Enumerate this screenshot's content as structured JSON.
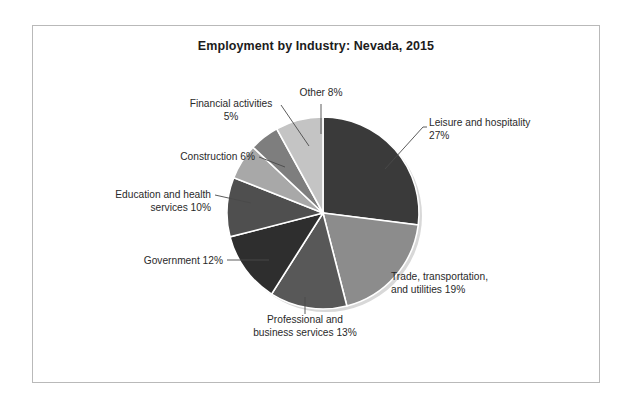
{
  "chart_data": {
    "type": "pie",
    "title": "Employment by Industry: Nevada, 2015",
    "xlabel": "",
    "ylabel": "",
    "legend_position": "none",
    "grid": false,
    "categories": [
      "Leisure and hospitality",
      "Trade, transportation, and utilities",
      "Professional and business services",
      "Government",
      "Education and health services",
      "Construction",
      "Financial activities",
      "Other"
    ],
    "values": [
      27,
      19,
      13,
      12,
      10,
      6,
      5,
      8
    ],
    "unit": "percent",
    "slices": [
      {
        "name": "Leisure and hospitality",
        "value": 27,
        "value_label": "27%",
        "label_line1": "Leisure and hospitality",
        "label_line2": "27%",
        "color": "#3a3a3a",
        "start_angle": 0,
        "end_angle": 97.2
      },
      {
        "name": "Trade, transportation, and utilities",
        "value": 19,
        "value_label": "19%",
        "label_line1": "Trade, transportation,",
        "label_line2": "and utilities 19%",
        "color": "#8c8c8c",
        "start_angle": 97.2,
        "end_angle": 165.6
      },
      {
        "name": "Professional and business services",
        "value": 13,
        "value_label": "13%",
        "label_line1": "Professional and",
        "label_line2": "business services 13%",
        "color": "#585858",
        "start_angle": 165.6,
        "end_angle": 212.4
      },
      {
        "name": "Government",
        "value": 12,
        "value_label": "12%",
        "label_line1": "Government 12%",
        "label_line2": "",
        "color": "#2e2e2e",
        "start_angle": 212.4,
        "end_angle": 255.6
      },
      {
        "name": "Education and health services",
        "value": 10,
        "value_label": "10%",
        "label_line1": "Education and health",
        "label_line2": "services 10%",
        "color": "#4f4f4f",
        "start_angle": 255.6,
        "end_angle": 291.6
      },
      {
        "name": "Construction",
        "value": 6,
        "value_label": "6%",
        "label_line1": "Construction  6%",
        "label_line2": "",
        "color": "#a8a8a8",
        "start_angle": 291.6,
        "end_angle": 313.2
      },
      {
        "name": "Financial activities",
        "value": 5,
        "value_label": "5%",
        "label_line1": "Financial activities",
        "label_line2": "5%",
        "color": "#7e7e7e",
        "start_angle": 313.2,
        "end_angle": 331.2
      },
      {
        "name": "Other",
        "value": 8,
        "value_label": "8%",
        "label_line1": "Other 8%",
        "label_line2": "",
        "color": "#c4c4c4",
        "start_angle": 331.2,
        "end_angle": 360
      }
    ],
    "geometry": {
      "center_x": 290,
      "center_y": 187,
      "radius": 96
    },
    "annotations": [
      {
        "key": "leisure",
        "text_x": 396,
        "text_y": 100,
        "anchor": "start",
        "line": "M 352 143 L 390 101 L 394 101"
      },
      {
        "key": "trade",
        "text_x": 358,
        "text_y": 254,
        "anchor": "start",
        "line": ""
      },
      {
        "key": "professional",
        "text_x": 272,
        "text_y": 297,
        "anchor": "middle",
        "line": "M 272 271 L 272 288"
      },
      {
        "key": "government",
        "text_x": 190,
        "text_y": 238,
        "anchor": "end",
        "line": "M 194 234 L 236 234"
      },
      {
        "key": "education",
        "text_x": 178,
        "text_y": 172,
        "anchor": "end",
        "line": "M 182 169 L 218 177"
      },
      {
        "key": "construction",
        "text_x": 222,
        "text_y": 134,
        "anchor": "end",
        "line": "M 226 131 L 252 141"
      },
      {
        "key": "financial",
        "text_x": 198,
        "text_y": 81,
        "anchor": "middle",
        "line": "M 248 79 L 276 120"
      },
      {
        "key": "other",
        "text_x": 288,
        "text_y": 70,
        "anchor": "middle",
        "line": "M 288 78 L 288 108"
      }
    ]
  }
}
